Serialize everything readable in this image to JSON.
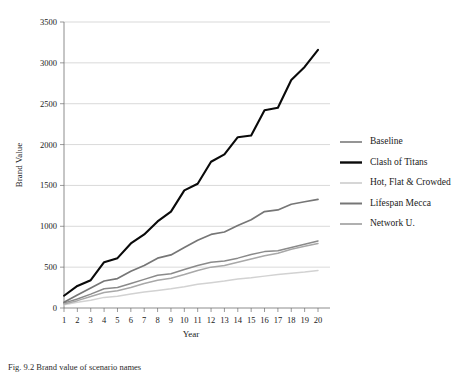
{
  "caption": "Fig. 9.2  Brand value of scenario names",
  "chart_data": {
    "type": "line",
    "title": "",
    "xlabel": "Year",
    "ylabel": "Brand Value",
    "xlim": [
      1,
      20
    ],
    "ylim": [
      0,
      3500
    ],
    "ytick_step": 500,
    "grid": "horizontal",
    "legend_position": "right",
    "categories": [
      1,
      2,
      3,
      4,
      5,
      6,
      7,
      8,
      9,
      10,
      11,
      12,
      13,
      14,
      15,
      16,
      17,
      18,
      19,
      20
    ],
    "xticks": [
      "1",
      "2",
      "3",
      "4",
      "5",
      "6",
      "7",
      "8",
      "9",
      "10",
      "11",
      "12",
      "13",
      "14",
      "15",
      "16",
      "17",
      "18",
      "19",
      "20"
    ],
    "yticks": [
      "0",
      "500",
      "1000",
      "1500",
      "2000",
      "2500",
      "3000",
      "3500"
    ],
    "series": [
      {
        "name": "Baseline",
        "color": "#8a8a8a",
        "width": 1.5,
        "values": [
          60,
          110,
          170,
          235,
          250,
          300,
          350,
          400,
          420,
          470,
          520,
          560,
          575,
          610,
          655,
          690,
          700,
          740,
          780,
          820
        ]
      },
      {
        "name": "Clash of Titans",
        "color": "#0a0a0a",
        "width": 2.1,
        "values": [
          150,
          270,
          340,
          560,
          610,
          790,
          900,
          1060,
          1180,
          1440,
          1520,
          1790,
          1880,
          2090,
          2110,
          2420,
          2450,
          2790,
          2950,
          3160
        ]
      },
      {
        "name": "Hot, Flat & Crowded",
        "color": "#d2d2d2",
        "width": 1.5,
        "values": [
          40,
          70,
          95,
          130,
          145,
          170,
          195,
          215,
          235,
          260,
          290,
          310,
          330,
          355,
          370,
          390,
          410,
          425,
          440,
          460
        ]
      },
      {
        "name": "Lifespan Mecca",
        "color": "#767676",
        "width": 1.7,
        "values": [
          70,
          160,
          245,
          330,
          360,
          450,
          520,
          610,
          650,
          740,
          830,
          900,
          930,
          1010,
          1080,
          1180,
          1200,
          1270,
          1300,
          1330
        ]
      },
      {
        "name": "Network U.",
        "color": "#a8a8a8",
        "width": 1.5,
        "values": [
          50,
          90,
          140,
          190,
          210,
          250,
          300,
          340,
          365,
          410,
          460,
          500,
          520,
          560,
          600,
          640,
          670,
          720,
          755,
          790
        ]
      }
    ]
  }
}
